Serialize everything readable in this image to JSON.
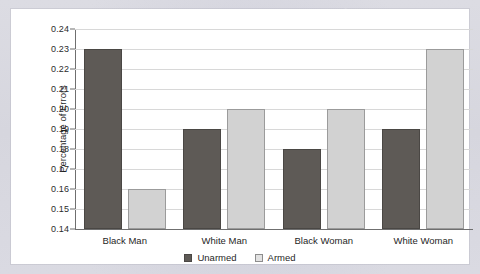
{
  "chart_data": {
    "type": "bar",
    "title": "",
    "xlabel": "",
    "ylabel": "Percentage of Errors",
    "categories": [
      "Black Man",
      "White Man",
      "Black Woman",
      "White Woman"
    ],
    "series": [
      {
        "name": "Unarmed",
        "color": "#5e5a56",
        "values": [
          0.23,
          0.19,
          0.18,
          0.19
        ]
      },
      {
        "name": "Armed",
        "color": "#d2d2d2",
        "values": [
          0.16,
          0.2,
          0.2,
          0.23
        ]
      }
    ],
    "ylim": [
      0.14,
      0.24
    ],
    "ytick_step": 0.01,
    "ytick_labels": [
      "0.24",
      "0.23",
      "0.22",
      "0.21",
      "0.20",
      "0.19",
      "0.18",
      "0.17",
      "0.16",
      "0.15",
      "0.14"
    ],
    "ytick_values": [
      0.24,
      0.23,
      0.22,
      0.21,
      0.2,
      0.19,
      0.18,
      0.17,
      0.16,
      0.15,
      0.14
    ],
    "grid": true,
    "grid_axis": "y",
    "legend_position": "bottom-center",
    "bar_group_mode": "grouped"
  },
  "colors": {
    "page_background": "#d9d9e0",
    "panel_background": "#ffffff",
    "gridline": "#d8d8d8",
    "axis": "#6f6f6f",
    "text": "#1f1f1f",
    "unarmed": "#5e5a56",
    "armed": "#d2d2d2"
  }
}
